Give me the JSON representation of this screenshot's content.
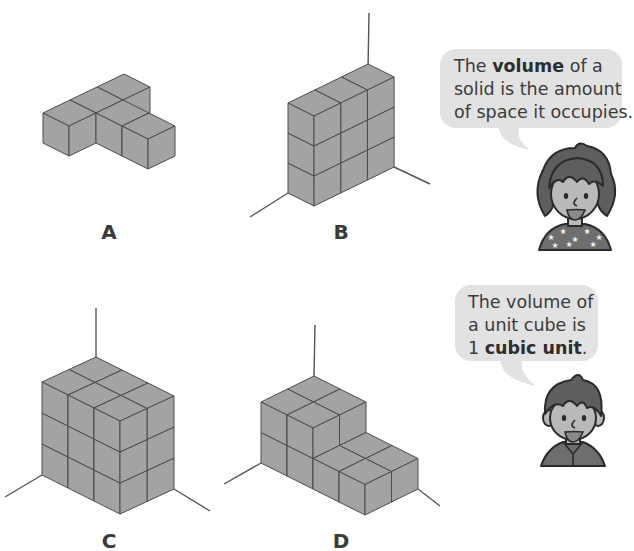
{
  "colors": {
    "cube_face": "#a3a3a3",
    "cube_edge": "#4d4d4d",
    "axis": "#555555",
    "bubble": "#e2e2e2",
    "skin": "#b9b9b9",
    "hair": "#5e5e5e",
    "outline": "#2a2a2a",
    "shirt": "#6e6e6e"
  },
  "shapes": [
    {
      "id": "A",
      "label": "A",
      "label_pos": [
        109,
        222
      ],
      "origin": [
        43,
        143
      ],
      "unit": {
        "a": [
          26,
          13
        ],
        "b": [
          27,
          -13
        ],
        "h": 30
      },
      "axes": false,
      "cubes": [
        [
          0,
          0,
          0
        ],
        [
          0,
          1,
          0
        ],
        [
          0,
          2,
          0
        ],
        [
          1,
          1,
          0
        ],
        [
          2,
          1,
          0
        ]
      ]
    },
    {
      "id": "B",
      "label": "B",
      "label_pos": [
        341,
        222
      ],
      "origin": [
        288,
        193
      ],
      "unit": {
        "a": [
          26,
          13
        ],
        "b": [
          26.7,
          -13
        ],
        "h": 30
      },
      "axes": {
        "up": [
          369,
          13
        ],
        "left": [
          250,
          217
        ],
        "right": [
          430,
          184
        ]
      },
      "size": [
        1,
        3,
        3
      ]
    },
    {
      "id": "C",
      "label": "C",
      "label_pos": [
        109,
        531
      ],
      "origin": [
        42,
        475
      ],
      "unit": {
        "a": [
          26,
          13
        ],
        "b": [
          27,
          -12.5
        ],
        "h": 31
      },
      "axes": {
        "up": [
          96,
          308
        ],
        "left": [
          5,
          497
        ],
        "right": [
          210,
          511
        ]
      },
      "size": [
        3,
        2,
        3
      ]
    },
    {
      "id": "D",
      "label": "D",
      "label_pos": [
        341,
        531
      ],
      "origin": [
        261,
        463
      ],
      "unit": {
        "a": [
          26,
          13
        ],
        "b": [
          26.5,
          -13
        ],
        "h": 30.5
      },
      "axes": {
        "up": [
          315,
          325
        ],
        "left": [
          224,
          484
        ],
        "right": [
          440,
          506
        ]
      },
      "heights": [
        [
          2,
          2
        ],
        [
          2,
          2
        ],
        [
          1,
          1
        ],
        [
          1,
          1
        ]
      ]
    }
  ],
  "bubbles": [
    {
      "id": "volume-definition",
      "rect": [
        440,
        49,
        182,
        79
      ],
      "tail": [
        [
          498,
          128
        ],
        [
          530,
          150
        ],
        [
          512,
          128
        ]
      ],
      "text_pos": [
        454,
        55
      ],
      "lines": [
        {
          "pre": "The ",
          "bold": "volume",
          "post": " of a"
        },
        {
          "pre": "solid is the amount",
          "bold": "",
          "post": ""
        },
        {
          "pre": "of space it occupies.",
          "bold": "",
          "post": ""
        }
      ]
    },
    {
      "id": "unit-cube-definition",
      "rect": [
        455,
        285,
        143,
        76
      ],
      "tail": [
        [
          500,
          361
        ],
        [
          536,
          386
        ],
        [
          515,
          361
        ]
      ],
      "text_pos": [
        468,
        291
      ],
      "lines": [
        {
          "pre": "The volume of",
          "bold": "",
          "post": ""
        },
        {
          "pre": "a unit cube is",
          "bold": "",
          "post": ""
        },
        {
          "pre": "1 ",
          "bold": "cubic unit",
          "post": "."
        }
      ]
    }
  ],
  "characters": [
    {
      "id": "girl",
      "cx": 575,
      "cy": 198,
      "hair": "curly"
    },
    {
      "id": "boy",
      "cx": 573,
      "cy": 420,
      "hair": "short"
    }
  ]
}
